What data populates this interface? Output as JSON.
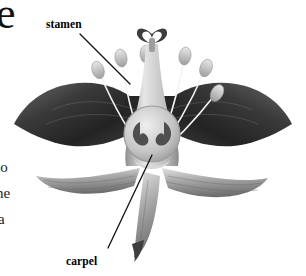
{
  "figure": {
    "kind": "botanical-illustration",
    "style": "grayscale halftone",
    "background_color": "#ffffff",
    "labels": [
      {
        "id": "stamen",
        "text": "stamen",
        "x": 46,
        "y": 18,
        "leader": {
          "x1": 80,
          "y1": 34,
          "x2": 130,
          "y2": 84
        }
      },
      {
        "id": "carpel",
        "text": "carpel",
        "x": 66,
        "y": 255,
        "leader": {
          "x1": 108,
          "y1": 248,
          "x2": 152,
          "y2": 155
        }
      }
    ],
    "margin_text": [
      {
        "id": "dropcap-e",
        "text": "e",
        "x": -4,
        "y": 2
      },
      {
        "id": "line-to",
        "text": "to",
        "x": -4,
        "y": 160
      },
      {
        "id": "line-ne",
        "text": "ne",
        "x": -4,
        "y": 186
      },
      {
        "id": "line-a",
        "text": "a",
        "x": -2,
        "y": 212
      }
    ],
    "colors": {
      "tepal_dark": "#2b2b2b",
      "tepal_dark_mid": "#4a4a4a",
      "tepal_light": "#9a9a9a",
      "tepal_light_hi": "#d2d2d2",
      "style_body": "#c9c9c9",
      "anther": "#cfcfcf",
      "filament": "#f2f2f2",
      "stigma": "#3d3d3d",
      "ovary_chamber": "#4f4f4f",
      "leader_line": "#111111",
      "label_text": "#000000"
    },
    "parts": {
      "stamen_count": 6,
      "tepal_upper_dark_count": 2,
      "tepal_lower_light_count": 3,
      "stigma_lobes": 3,
      "ovary_chambers": 2
    }
  }
}
